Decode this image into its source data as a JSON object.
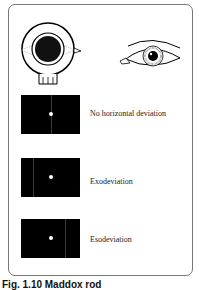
{
  "figure": {
    "top_left_icon": "maddox-rod-device-icon",
    "top_right_icon": "eye-icon",
    "rows": [
      {
        "label": "No horizontal deviation",
        "line_position": "center"
      },
      {
        "label": "Exodeviation",
        "line_position": "left"
      },
      {
        "label": "Esodeviation",
        "line_position": "right"
      }
    ],
    "caption": "Fig. 1.10 Maddox rod"
  }
}
